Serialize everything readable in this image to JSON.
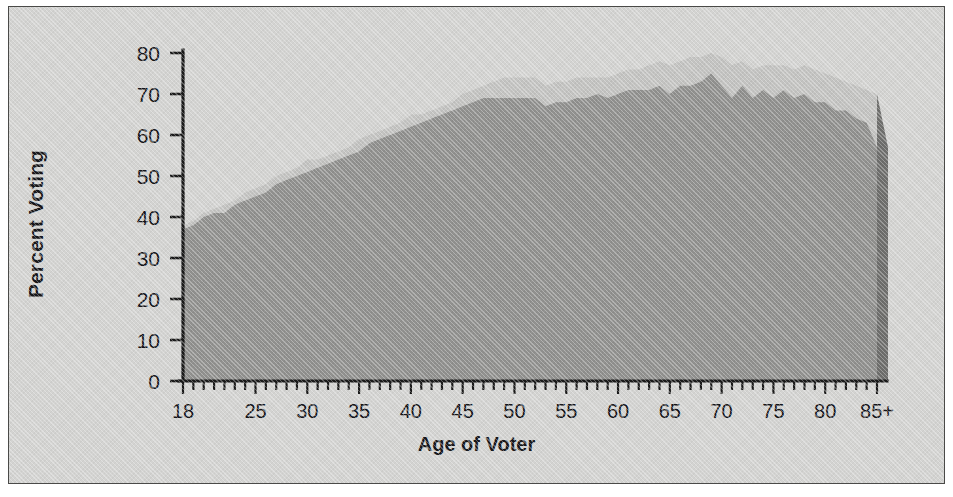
{
  "figure": {
    "panel_background": "#d3d3d1",
    "border_color": "#4a4a48"
  },
  "axes": {
    "ylabel": "Percent Voting",
    "xlabel": "Age of Voter",
    "y_ticks": [
      0,
      10,
      20,
      30,
      40,
      50,
      60,
      70,
      80
    ],
    "x_tick_labels": [
      "18",
      "25",
      "30",
      "35",
      "40",
      "45",
      "50",
      "55",
      "60",
      "65",
      "70",
      "75",
      "80",
      "85+"
    ],
    "x_tick_label_values": [
      18,
      25,
      30,
      35,
      40,
      45,
      50,
      55,
      60,
      65,
      70,
      75,
      80,
      85
    ]
  },
  "chart_data": {
    "type": "area",
    "title": "",
    "subtitle": "",
    "xlabel": "Age of Voter",
    "ylabel": "Percent Voting",
    "xlim": [
      18,
      85
    ],
    "ylim": [
      0,
      80
    ],
    "grid": false,
    "legend": "none",
    "annotations": [],
    "x": [
      18,
      19,
      20,
      21,
      22,
      23,
      24,
      25,
      26,
      27,
      28,
      29,
      30,
      31,
      32,
      33,
      34,
      35,
      36,
      37,
      38,
      39,
      40,
      41,
      42,
      43,
      44,
      45,
      46,
      47,
      48,
      49,
      50,
      51,
      52,
      53,
      54,
      55,
      56,
      57,
      58,
      59,
      60,
      61,
      62,
      63,
      64,
      65,
      66,
      67,
      68,
      69,
      70,
      71,
      72,
      73,
      74,
      75,
      76,
      77,
      78,
      79,
      80,
      81,
      82,
      83,
      84,
      85
    ],
    "x_tick_label_for_last": "85+",
    "series": [
      {
        "name": "upper-band",
        "color": "#c2c2c0",
        "values": [
          38,
          39,
          41,
          42,
          43,
          44,
          46,
          47,
          48,
          50,
          51,
          52,
          54,
          54,
          55,
          56,
          57,
          59,
          60,
          61,
          62,
          63,
          65,
          65,
          66,
          67,
          68,
          70,
          71,
          72,
          73,
          74,
          74,
          74,
          74,
          72,
          73,
          73,
          74,
          74,
          74,
          74,
          75,
          76,
          76,
          77,
          78,
          77,
          78,
          79,
          79,
          80,
          79,
          77,
          78,
          76,
          77,
          77,
          77,
          76,
          77,
          76,
          75,
          74,
          73,
          72,
          71,
          70
        ]
      },
      {
        "name": "lower-band",
        "color": "#8f8f8d",
        "values": [
          37,
          38,
          40,
          41,
          41,
          43,
          44,
          45,
          46,
          48,
          49,
          50,
          51,
          52,
          53,
          54,
          55,
          56,
          58,
          59,
          60,
          61,
          62,
          63,
          64,
          65,
          66,
          67,
          68,
          69,
          69,
          69,
          69,
          69,
          69,
          67,
          68,
          68,
          69,
          69,
          70,
          69,
          70,
          71,
          71,
          71,
          72,
          70,
          72,
          72,
          73,
          75,
          72,
          69,
          72,
          69,
          71,
          69,
          71,
          69,
          70,
          68,
          68,
          66,
          66,
          64,
          63,
          57
        ]
      }
    ],
    "end_face_color": "#6e6e6c",
    "peak": {
      "age": 69,
      "upper": 80,
      "lower": 75
    },
    "start": {
      "age": 18,
      "upper": 38,
      "lower": 37
    }
  }
}
